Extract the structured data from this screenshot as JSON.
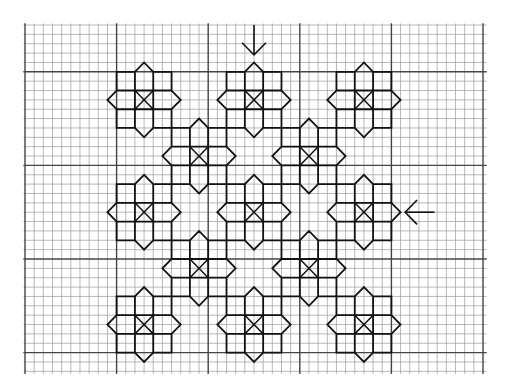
{
  "colors": {
    "background": "#ffffff",
    "minor_grid": "#9a9a9a",
    "major_grid": "#444444",
    "pattern": "#111111"
  },
  "grid": {
    "origin_px": [
      25,
      25
    ],
    "cell_w_px": 9.16,
    "cell_h_px": 9.36,
    "cols": 50,
    "rows": 37,
    "major_col_offset": 0,
    "major_row_offset": 5,
    "major_every": 10
  },
  "motif": {
    "description": "3x3 block star: each block 2x2 cells, middle edge blocks pointed outward by 1 cell, center block crossed with an X",
    "block_cells": 2
  },
  "motifs": [
    {
      "cx": 13,
      "cy": 8
    },
    {
      "cx": 25,
      "cy": 8
    },
    {
      "cx": 37,
      "cy": 8
    },
    {
      "cx": 19,
      "cy": 14
    },
    {
      "cx": 31,
      "cy": 14
    },
    {
      "cx": 13,
      "cy": 20
    },
    {
      "cx": 25,
      "cy": 20
    },
    {
      "cx": 37,
      "cy": 20
    },
    {
      "cx": 19,
      "cy": 26
    },
    {
      "cx": 31,
      "cy": 26
    },
    {
      "cx": 13,
      "cy": 32
    },
    {
      "cx": 25,
      "cy": 32
    },
    {
      "cx": 37,
      "cy": 32
    }
  ],
  "arrows": [
    {
      "name": "top-center-arrow",
      "direction": "down",
      "x": 25,
      "from": 0,
      "to": 3.2
    },
    {
      "name": "right-side-arrow",
      "direction": "left",
      "y": 20,
      "from": 44.7,
      "to": 41.5
    }
  ]
}
